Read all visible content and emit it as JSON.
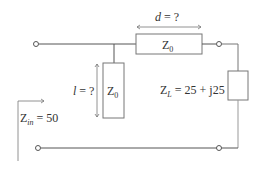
{
  "diagram": {
    "type": "transmission-line-stub-matching-circuit",
    "colors": {
      "wire": "#555555",
      "text": "#333333",
      "box_fill": "#ffffff"
    },
    "labels": {
      "series_length": "d = ?",
      "series_length_var": "d",
      "series_length_rest": " = ?",
      "series_line_impedance": "Z",
      "series_line_impedance_sub": "0",
      "stub_length_var": "l",
      "stub_length_rest": " = ?",
      "stub_impedance": "Z",
      "stub_impedance_sub": "0",
      "load_impedance": "Z",
      "load_impedance_sub": "L",
      "load_value": " = 25 + j25",
      "input_impedance": "Z",
      "input_impedance_sub": "in",
      "input_value": " = 50"
    },
    "components": [
      {
        "id": "series-line",
        "kind": "transmission-line",
        "impedance": "Z0",
        "length": "d = ?"
      },
      {
        "id": "shunt-stub",
        "kind": "transmission-line-stub",
        "impedance": "Z0",
        "length": "l = ?"
      },
      {
        "id": "load",
        "kind": "impedance",
        "value": "ZL = 25 + j25"
      }
    ],
    "input": {
      "label": "Zin = 50"
    }
  }
}
